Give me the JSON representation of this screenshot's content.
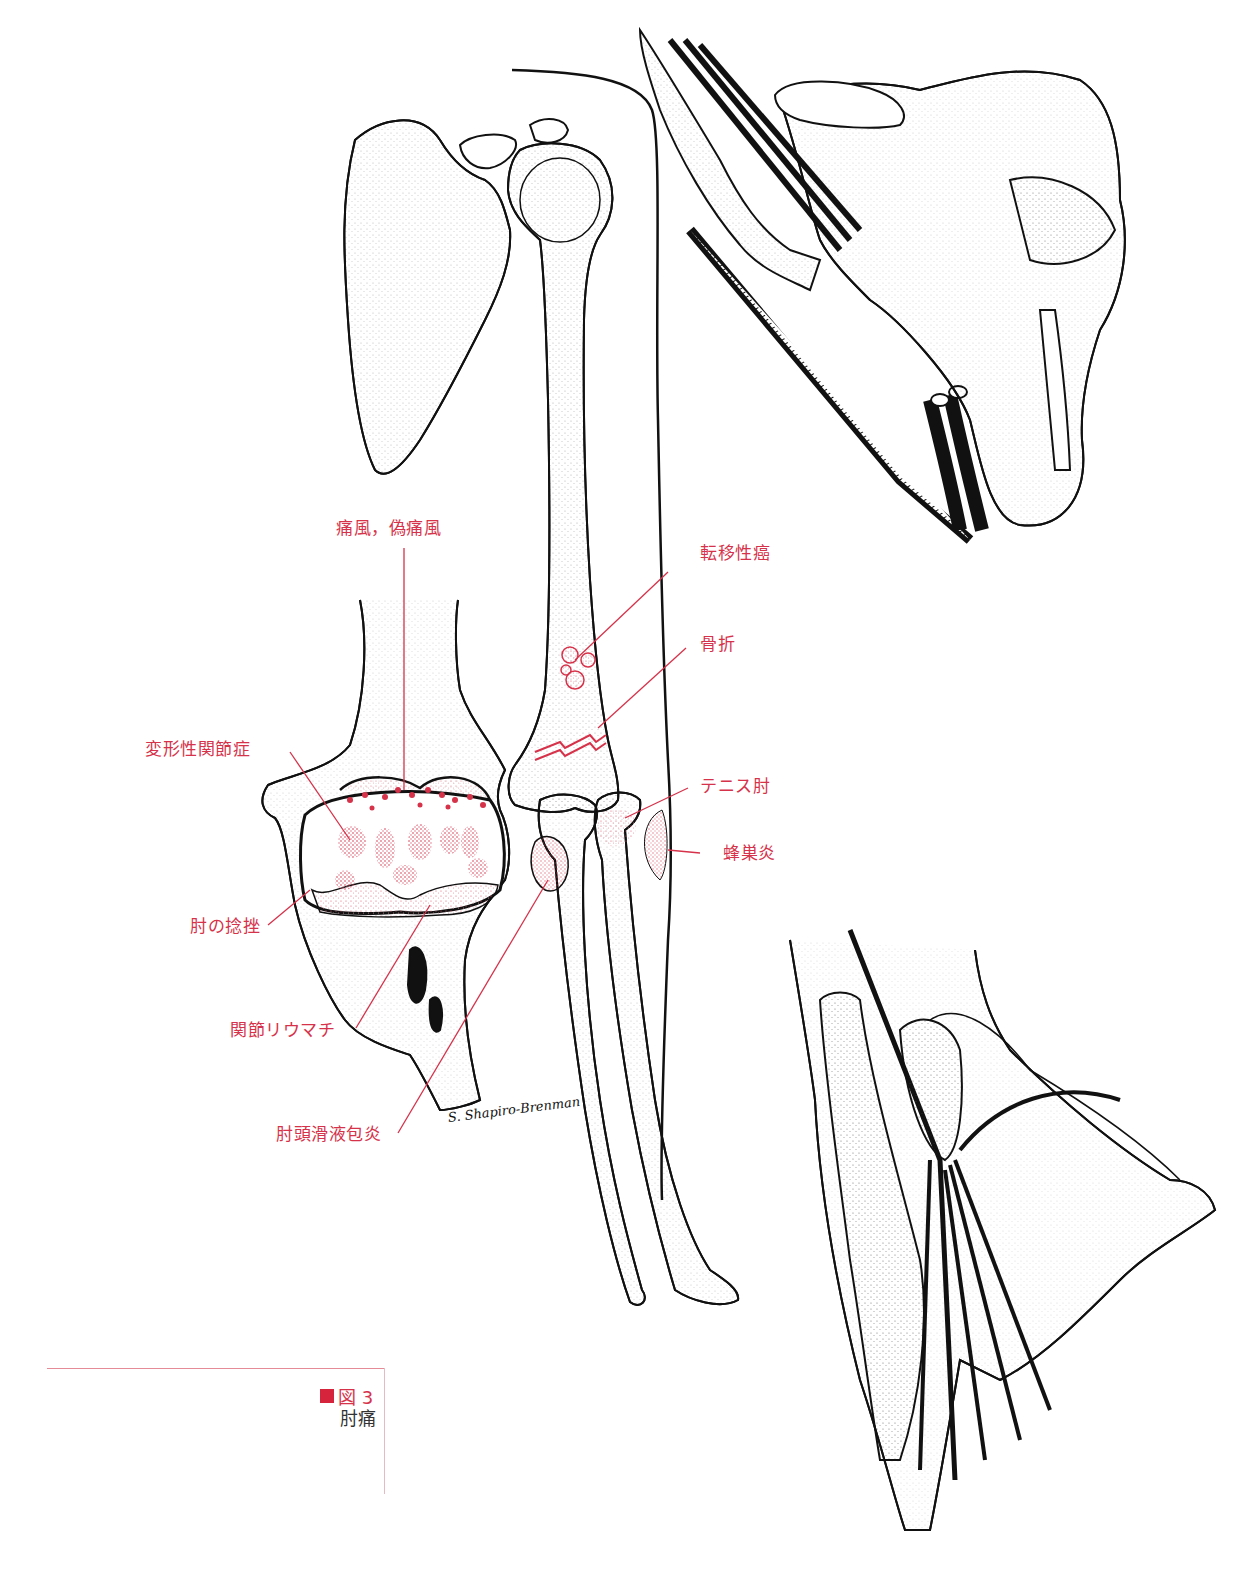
{
  "figure": {
    "number_label": "図 3",
    "title": "肘痛",
    "marker_color": "#d6243c",
    "label_color": "#d6324a",
    "caption_rule_color": "#e58a97"
  },
  "labels": {
    "gout": "痛風，偽痛風",
    "metastatic_cancer": "転移性癌",
    "fracture": "骨折",
    "osteoarthritis": "変形性関節症",
    "tennis_elbow": "テニス肘",
    "cellulitis": "蜂巣炎",
    "elbow_sprain": "肘の捻挫",
    "rheumatoid_arthritis": "関節リウマチ",
    "olecranon_bursitis": "肘頭滑液包炎"
  },
  "signature": "S. Shapiro-Brenman",
  "panels": [
    {
      "id": "shoulder-arm-skeleton",
      "description": "scapula, humerus, radius and ulna skeleton"
    },
    {
      "id": "elbow-joint-closeup",
      "description": "opened elbow joint with red stippled lesions"
    },
    {
      "id": "shoulder-vessels-nerves",
      "description": "shoulder with brachial plexus and vessels"
    },
    {
      "id": "forearm-hand-tendons",
      "description": "forearm and hand tendons and nerves"
    }
  ]
}
